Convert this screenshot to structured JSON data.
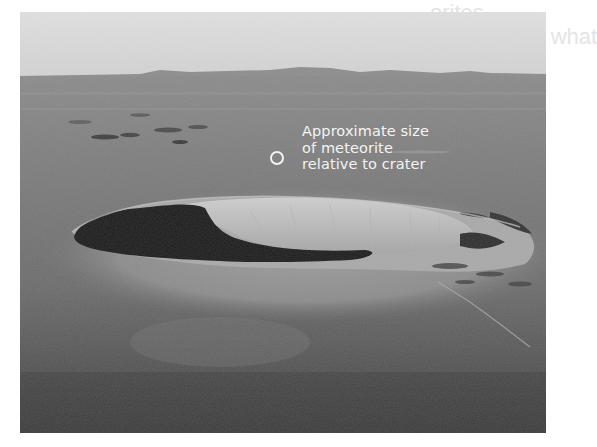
{
  "figure": {
    "annotation": {
      "line1": "Approximate size",
      "line2": "of meteorite",
      "line3": "relative to crater"
    },
    "marker": "open-circle",
    "colors": {
      "sky": "#dcdcdc",
      "plain": "#7a7a7a",
      "crater_wall": "#bdbdbd",
      "shadow": "#1e1e1e",
      "annotation_text": "#f4f4f4"
    }
  },
  "background_text": {
    "line1": "orites",
    "line2": "oject of meteorites, using what"
  }
}
